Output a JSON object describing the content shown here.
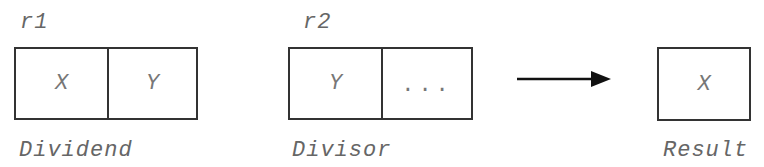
{
  "registers": [
    {
      "name": "r1",
      "cells": [
        "X",
        "Y"
      ],
      "caption": "Dividend"
    },
    {
      "name": "r2",
      "cells": [
        "Y",
        "..."
      ],
      "caption": "Divisor"
    }
  ],
  "result": {
    "cells": [
      "X"
    ],
    "caption": "Result"
  },
  "arrow": {
    "direction": "right",
    "color": "#111111"
  }
}
